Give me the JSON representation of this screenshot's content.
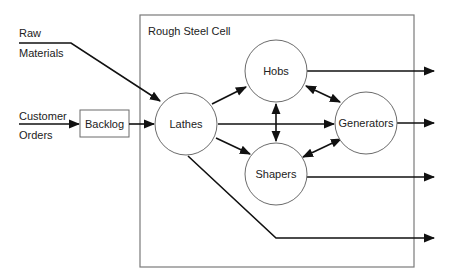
{
  "diagram": {
    "cell_title": "Rough Steel Cell",
    "inputs": {
      "raw_materials": [
        "Raw",
        "Materials"
      ],
      "customer_orders": [
        "Customer",
        "Orders"
      ]
    },
    "backlog": {
      "label": "Backlog"
    },
    "nodes": {
      "lathes": {
        "label": "Lathes"
      },
      "hobs": {
        "label": "Hobs"
      },
      "generators": {
        "label": "Generators"
      },
      "shapers": {
        "label": "Shapers"
      }
    },
    "edges": [
      {
        "from": "Raw Materials",
        "to": "Lathes",
        "direction": "one-way"
      },
      {
        "from": "Customer Orders",
        "to": "Backlog",
        "direction": "one-way"
      },
      {
        "from": "Backlog",
        "to": "Lathes",
        "direction": "one-way"
      },
      {
        "from": "Lathes",
        "to": "Hobs",
        "direction": "one-way"
      },
      {
        "from": "Lathes",
        "to": "Generators",
        "direction": "one-way"
      },
      {
        "from": "Lathes",
        "to": "Shapers",
        "direction": "one-way"
      },
      {
        "from": "Hobs",
        "to": "Shapers",
        "direction": "two-way"
      },
      {
        "from": "Hobs",
        "to": "Generators",
        "direction": "two-way"
      },
      {
        "from": "Shapers",
        "to": "Generators",
        "direction": "two-way"
      },
      {
        "from": "Hobs",
        "to": "Output",
        "direction": "one-way"
      },
      {
        "from": "Generators",
        "to": "Output",
        "direction": "one-way"
      },
      {
        "from": "Shapers",
        "to": "Output",
        "direction": "one-way"
      },
      {
        "from": "Lathes",
        "to": "Output",
        "direction": "one-way"
      }
    ],
    "colors": {
      "line": "#111111",
      "outline": "#6b6b6b",
      "text": "#222222",
      "background": "#ffffff"
    }
  }
}
